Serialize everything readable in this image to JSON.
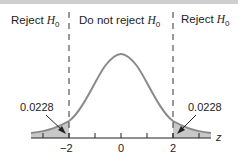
{
  "regions": {
    "left": {
      "text": "Reject ",
      "var": "H",
      "sub": "0"
    },
    "middle": {
      "text": "Do not reject ",
      "var": "H",
      "sub": "0"
    },
    "right": {
      "text": "Reject ",
      "var": "H",
      "sub": "0"
    }
  },
  "axis": {
    "label": "z",
    "ticks": [
      "−2",
      "0",
      "2"
    ]
  },
  "annotations": {
    "left_tail": "0.0228",
    "right_tail": "0.0228"
  },
  "colors": {
    "curve": "#8a8a8a",
    "shade": "#c8c8c8",
    "axis": "#222222"
  }
}
